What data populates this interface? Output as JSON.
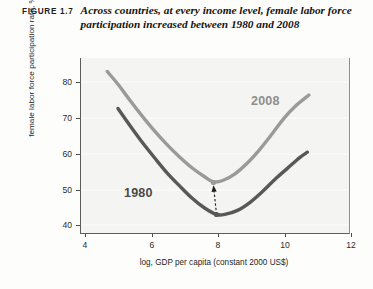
{
  "caption": {
    "figure_number": "FIGURE 1.7",
    "text": "Across countries, at every income level, female labor force participation increased between 1980 and 2008"
  },
  "colors": {
    "series_1980": "#585856",
    "series_2008": "#9a9a98",
    "plot_background": "#f4f4f2",
    "gridline": "#ffffff",
    "axis": "#5c5c5a",
    "annotation_arrow": "#1c1c1a"
  },
  "chart_data": {
    "type": "line",
    "title": "Across countries, at every income level, female labor force participation increased between 1980 and 2008",
    "xlabel": "log, GDP per capita (constant 2000 US$)",
    "ylabel": "female labor force participation rate, %",
    "xlim": [
      3.7,
      12.4
    ],
    "ylim": [
      36,
      88
    ],
    "xticks": [
      4,
      6,
      8,
      10,
      12
    ],
    "yticks": [
      40,
      50,
      60,
      70,
      80
    ],
    "xtick_labels": [
      "4",
      "6",
      "8",
      "10",
      "12"
    ],
    "ytick_labels": [
      "40",
      "50",
      "60",
      "70",
      "80"
    ],
    "grid": "horizontal",
    "legend": "inline-labels",
    "series": [
      {
        "name": "2008",
        "color": "#9a9a98",
        "label_position": {
          "x": 10.1,
          "y": 69.5
        },
        "minimum": {
          "x": 8.0,
          "y": 51.0
        },
        "x": [
          4.55,
          4.9,
          5.3,
          5.7,
          6.1,
          6.5,
          6.9,
          7.3,
          7.7,
          8.0,
          8.3,
          8.7,
          9.1,
          9.5,
          9.9,
          10.3,
          10.7,
          11.1
        ],
        "y": [
          84.0,
          80.2,
          75.3,
          70.6,
          66.2,
          62.2,
          58.6,
          55.4,
          52.8,
          51.2,
          51.6,
          53.6,
          56.8,
          60.8,
          65.4,
          70.2,
          74.0,
          77.0
        ]
      },
      {
        "name": "1980",
        "color": "#585856",
        "label_position": {
          "x": 6.2,
          "y": 44.5
        },
        "minimum": {
          "x": 8.1,
          "y": 41.5
        },
        "x": [
          4.9,
          5.3,
          5.7,
          6.1,
          6.5,
          6.9,
          7.3,
          7.7,
          8.1,
          8.4,
          8.8,
          9.2,
          9.6,
          10.0,
          10.4,
          10.8,
          11.05
        ],
        "y": [
          73.0,
          67.8,
          62.8,
          58.2,
          53.8,
          50.0,
          46.4,
          43.5,
          41.5,
          41.6,
          42.8,
          45.2,
          48.4,
          52.0,
          55.2,
          58.4,
          60.0
        ]
      }
    ],
    "annotations": [
      {
        "type": "arrow",
        "style": "dashed",
        "from": {
          "x": 8.1,
          "y": 41.5
        },
        "to": {
          "x": 8.0,
          "y": 50.2
        },
        "description": "increase from 1980 minimum to 2008 minimum"
      },
      {
        "type": "marker",
        "x": 8.0,
        "y": 51.0,
        "series": "2008"
      },
      {
        "type": "marker",
        "x": 8.1,
        "y": 41.5,
        "series": "1980"
      }
    ]
  }
}
